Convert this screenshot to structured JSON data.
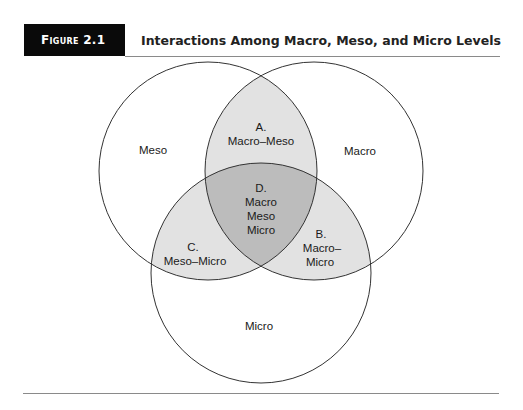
{
  "figure": {
    "label": "Figure 2.1",
    "title": "Interactions Among Macro, Meso, and Micro Levels"
  },
  "colors": {
    "circle_stroke": "#333333",
    "pairwise_overlap_fill": "#e2e2e2",
    "triple_overlap_fill": "#bcbcbc",
    "header_bg": "#0a0a0a"
  },
  "diagram": {
    "sets": [
      {
        "id": "meso",
        "label": "Meso"
      },
      {
        "id": "macro",
        "label": "Macro"
      },
      {
        "id": "micro",
        "label": "Micro"
      }
    ],
    "regions": {
      "A": {
        "letter": "A.",
        "lines": [
          "Macro–Meso"
        ]
      },
      "B": {
        "letter": "B.",
        "lines": [
          "Macro–",
          "Micro"
        ]
      },
      "C": {
        "letter": "C.",
        "lines": [
          "Meso–Micro"
        ]
      },
      "D": {
        "letter": "D.",
        "lines": [
          "Macro",
          "Meso",
          "Micro"
        ]
      }
    }
  }
}
